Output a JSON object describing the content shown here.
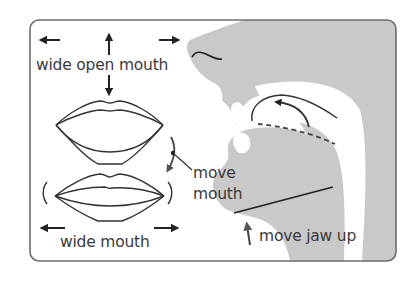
{
  "diagram": {
    "colors": {
      "frame": "#6e6e6e",
      "silhouette": "#c9c9c9",
      "ink": "#2a2a2a",
      "text": "#3a3a3a",
      "background": "#ffffff"
    },
    "labels": {
      "wide_open_mouth": "wide open mouth",
      "move_mouth_line1": "move",
      "move_mouth_line2": "mouth",
      "wide_mouth": "wide mouth",
      "move_jaw_up": "move jaw up"
    },
    "icons": [
      "arrow-left-icon",
      "arrow-up-icon",
      "arrow-right-icon",
      "arrow-down-icon",
      "curved-arrow-down-icon",
      "tongue-curl-arrow-icon",
      "jaw-up-arrow-icon"
    ]
  }
}
